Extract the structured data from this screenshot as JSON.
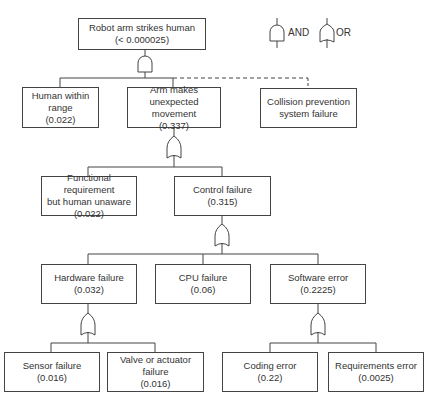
{
  "legend": {
    "and_label": "AND",
    "or_label": "OR"
  },
  "nodes": {
    "top": {
      "label": "Robot arm strikes human",
      "value": "(< 0.000025)",
      "gate": "AND"
    },
    "human_within_range": {
      "label_1": "Human within",
      "label_2": "range",
      "value": "(0.022)"
    },
    "arm_unexpected": {
      "label_1": "Arm makes unexpected",
      "label_2": "movement",
      "value": "(0.337)",
      "gate": "OR"
    },
    "collision_prevention": {
      "label_1": "Collision prevention",
      "label_2": "system failure",
      "connector": "dashed"
    },
    "functional_requirement": {
      "label_1": "Functional requirement",
      "label_2": "but human unaware",
      "value": "(0.022)"
    },
    "control_failure": {
      "label": "Control failure",
      "value": "(0.315)",
      "gate": "OR"
    },
    "hardware_failure": {
      "label": "Hardware failure",
      "value": "(0.032)",
      "gate": "OR"
    },
    "cpu_failure": {
      "label": "CPU failure",
      "value": "(0.06)"
    },
    "software_error": {
      "label": "Software error",
      "value": "(0.2225)",
      "gate": "OR"
    },
    "sensor_failure": {
      "label": "Sensor failure",
      "value": "(0.016)"
    },
    "valve_actuator_failure": {
      "label": "Valve or actuator failure",
      "value": "(0.016)"
    },
    "coding_error": {
      "label": "Coding error",
      "value": "(0.22)"
    },
    "requirements_error": {
      "label": "Requirements error",
      "value": "(0.0025)"
    }
  },
  "colors": {
    "line": "#444444",
    "text": "#333333",
    "background": "#ffffff"
  }
}
